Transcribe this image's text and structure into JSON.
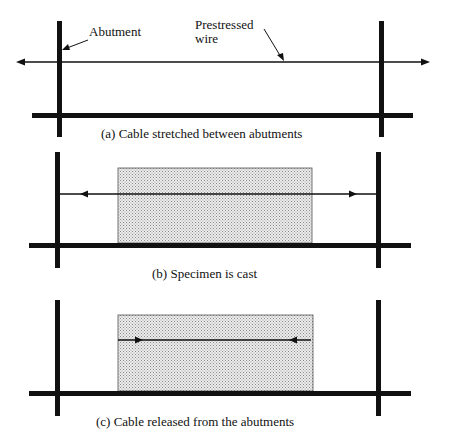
{
  "figure": {
    "panels": [
      {
        "id": "a",
        "caption": "(a) Cable stretched between  abutments",
        "labels": {
          "abutment": "Abutment",
          "wire_line1": "Prestressed",
          "wire_line2": "wire"
        },
        "has_specimen": false,
        "cable_arrows": "outward, beyond abutments"
      },
      {
        "id": "b",
        "caption": "(b) Specimen is cast",
        "has_specimen": true,
        "cable_arrows": "outward, toward abutments"
      },
      {
        "id": "c",
        "caption": "(c) Cable released from the abutments",
        "has_specimen": true,
        "cable_arrows": "inward, within specimen"
      }
    ],
    "colors": {
      "line": "#111111",
      "specimen_fill": "#e6e6e6",
      "specimen_dots": "#8a8a8a"
    }
  }
}
